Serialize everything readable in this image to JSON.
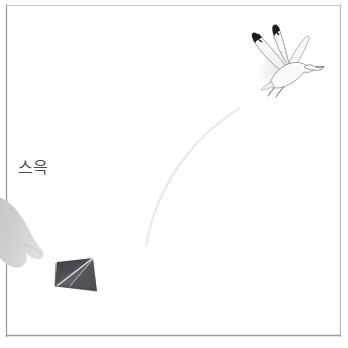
{
  "panel": {
    "width": 348,
    "height": 348,
    "background_color": "#ffffff",
    "border_color": "#9a9a9a",
    "border_note": "thin faint ruled panel frame",
    "frame": {
      "left": 6,
      "top": 5,
      "right": 341,
      "bottom": 336
    }
  },
  "sfx": {
    "text": "스윽",
    "romanization": "seu-euk",
    "color": "#4a4a4a",
    "x": 18,
    "y": 160,
    "font_size": 16
  },
  "bird": {
    "name": "seagull",
    "body_color": "#f3f3f3",
    "outline_color": "#7d7d7d",
    "wingtip_color": "#1c1c1c",
    "shadow_color": "#e6e6e6",
    "center_x": 287,
    "center_y": 62,
    "heading": "up-right"
  },
  "paper_airplane": {
    "name": "paper-airplane",
    "fill_color": "#59595c",
    "fold_color": "#e9e9ec",
    "dark_edge_color": "#2f2f33",
    "center_x": 75,
    "center_y": 277,
    "heading": "down-left"
  },
  "hand": {
    "name": "throwing-hand",
    "fill_color": "#cfcfcf",
    "edge_x": 0,
    "top_y": 196,
    "bottom_y": 268
  },
  "motion_trail": {
    "name": "motion-trail",
    "color": "#d8d8dc",
    "stroke_width": 1.2,
    "start": {
      "x": 146,
      "y": 246
    },
    "control": {
      "x": 168,
      "y": 150
    },
    "end": {
      "x": 240,
      "y": 108
    }
  },
  "colors": {
    "ink": "#1c1c1c",
    "paper": "#ffffff",
    "light_gray": "#cfcfcf",
    "mid_gray": "#7d7d7d",
    "trail_gray": "#d8d8dc"
  }
}
